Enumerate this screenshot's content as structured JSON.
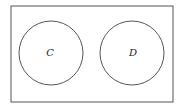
{
  "diagram": {
    "type": "venn",
    "universe": {
      "x": 11,
      "y": 6,
      "width": 162,
      "height": 96
    },
    "sets": [
      {
        "label": "C",
        "cx": 51,
        "cy": 53,
        "r": 32
      },
      {
        "label": "D",
        "cx": 132,
        "cy": 53,
        "r": 32
      }
    ],
    "relationship": "disjoint",
    "stroke_color": "#555555"
  }
}
